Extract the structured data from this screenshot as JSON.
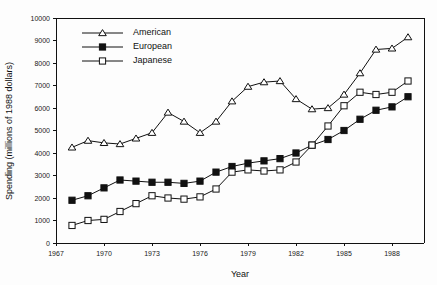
{
  "chart_data": {
    "type": "line",
    "title": "",
    "xlabel": "Year",
    "ylabel": "Spending (millions of 1988 dollars)",
    "xlim": [
      1967,
      1990
    ],
    "ylim": [
      0,
      10000
    ],
    "xticks": [
      1967,
      1970,
      1973,
      1976,
      1979,
      1982,
      1985,
      1988
    ],
    "yticks": [
      0,
      1000,
      2000,
      3000,
      4000,
      5000,
      6000,
      7000,
      8000,
      9000,
      10000
    ],
    "grid": false,
    "legend_position": "top-left",
    "x": [
      1968,
      1969,
      1970,
      1971,
      1972,
      1973,
      1974,
      1975,
      1976,
      1977,
      1978,
      1979,
      1980,
      1981,
      1982,
      1983,
      1984,
      1985,
      1986,
      1987,
      1988,
      1989
    ],
    "series": [
      {
        "name": "American",
        "marker": "open-triangle",
        "values": [
          4250,
          4550,
          4450,
          4400,
          4650,
          4900,
          5800,
          5400,
          4900,
          5400,
          6300,
          6950,
          7150,
          7200,
          6400,
          5950,
          6000,
          6600,
          7550,
          8600,
          8650,
          9150
        ]
      },
      {
        "name": "European",
        "marker": "filled-square",
        "values": [
          1900,
          2100,
          2450,
          2800,
          2750,
          2700,
          2700,
          2650,
          2750,
          3150,
          3400,
          3550,
          3650,
          3750,
          4000,
          4350,
          4600,
          5000,
          5500,
          5900,
          6050,
          6500
        ]
      },
      {
        "name": "Japanese",
        "marker": "open-square",
        "values": [
          780,
          1000,
          1050,
          1400,
          1750,
          2100,
          2000,
          1950,
          2050,
          2400,
          3150,
          3250,
          3200,
          3250,
          3600,
          4350,
          5200,
          6100,
          6700,
          6600,
          6700,
          7200
        ]
      }
    ],
    "legend": [
      {
        "label": "American",
        "marker": "open-triangle"
      },
      {
        "label": "European",
        "marker": "filled-square"
      },
      {
        "label": "Japanese",
        "marker": "open-square"
      }
    ]
  }
}
